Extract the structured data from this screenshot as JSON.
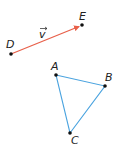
{
  "diagram": {
    "colors": {
      "vector": "#e8604a",
      "triangle": "#4aa3df",
      "points": "#111111",
      "labels": "#222222"
    },
    "vector": {
      "label": "v",
      "from": "D",
      "to": "E"
    },
    "points": {
      "D": {
        "label": "D",
        "x": 11,
        "y": 54
      },
      "E": {
        "label": "E",
        "x": 82,
        "y": 25
      },
      "A": {
        "label": "A",
        "x": 56,
        "y": 75
      },
      "B": {
        "label": "B",
        "x": 105,
        "y": 86
      },
      "C": {
        "label": "C",
        "x": 70,
        "y": 133
      }
    },
    "triangle": [
      "A",
      "B",
      "C"
    ]
  }
}
